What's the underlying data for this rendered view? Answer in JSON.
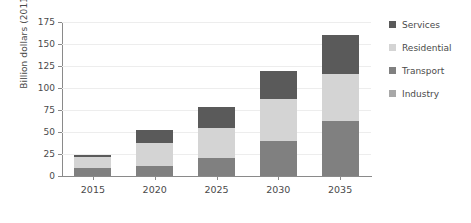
{
  "chart_data": {
    "type": "bar",
    "stacked": true,
    "title": "",
    "xlabel": "",
    "ylabel": "Billion dollars (2011)",
    "categories": [
      "2015",
      "2020",
      "2025",
      "2030",
      "2035"
    ],
    "ylim": [
      0,
      175
    ],
    "yticks": [
      0,
      25,
      50,
      75,
      100,
      125,
      150,
      175
    ],
    "ytick_labels": [
      "0",
      "25",
      "50",
      "75",
      "100",
      "125",
      "150",
      "175"
    ],
    "grid": true,
    "legend_position": "right",
    "stack_order_bottom_to_top": [
      "Industry",
      "Transport",
      "Residential",
      "Services"
    ],
    "series": [
      {
        "name": "Services",
        "color": "#5a5a5a",
        "values": [
          2,
          15,
          24,
          31,
          44
        ]
      },
      {
        "name": "Residential",
        "color": "#d4d4d4",
        "values": [
          13,
          26,
          35,
          48,
          53
        ]
      },
      {
        "name": "Transport",
        "color": "#808080",
        "values": [
          9,
          11,
          20,
          40,
          63
        ]
      },
      {
        "name": "Industry",
        "color": "#a8a8a8",
        "values": [
          0,
          0,
          0,
          0,
          0
        ]
      }
    ],
    "totals": [
      24,
      52,
      79,
      119,
      160
    ]
  },
  "legend": {
    "items": [
      {
        "label": "Services",
        "color": "#5a5a5a"
      },
      {
        "label": "Residential",
        "color": "#d4d4d4"
      },
      {
        "label": "Transport",
        "color": "#808080"
      },
      {
        "label": "Industry",
        "color": "#a8a8a8"
      }
    ]
  },
  "axes": {
    "y_title": "Billion dollars (2011)"
  }
}
